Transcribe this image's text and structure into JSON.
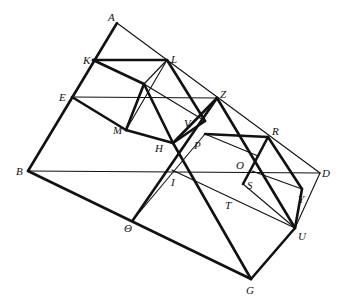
{
  "diagram": {
    "type": "geometric-figure",
    "stroke_color": "#111111",
    "background": "#ffffff",
    "points": {
      "A": [
        117,
        23
      ],
      "K": [
        93,
        60
      ],
      "L": [
        167,
        60
      ],
      "E": [
        72,
        97
      ],
      "Z": [
        217,
        98
      ],
      "M": [
        126,
        130
      ],
      "V": [
        205,
        121
      ],
      "H": [
        173,
        143
      ],
      "P": [
        205,
        134
      ],
      "R": [
        268,
        137
      ],
      "O": [
        258,
        156
      ],
      "S": [
        252,
        171
      ],
      "D": [
        320,
        173
      ],
      "B": [
        28,
        171
      ],
      "I": [
        172,
        170
      ],
      "T": [
        243,
        184
      ],
      "Y": [
        302,
        189
      ],
      "Theta": [
        133,
        220
      ],
      "U": [
        295,
        228
      ],
      "G": [
        251,
        279
      ],
      "N1": [
        144,
        84
      ],
      "N2": [
        272,
        155
      ]
    },
    "labels": [
      {
        "id": "A",
        "text": "A",
        "x": 108,
        "y": 21
      },
      {
        "id": "K",
        "text": "K",
        "x": 83,
        "y": 64
      },
      {
        "id": "L",
        "text": "L",
        "x": 171,
        "y": 63
      },
      {
        "id": "E",
        "text": "E",
        "x": 59,
        "y": 101
      },
      {
        "id": "Z",
        "text": "Z",
        "x": 220,
        "y": 98
      },
      {
        "id": "M",
        "text": "M",
        "x": 113,
        "y": 134
      },
      {
        "id": "V",
        "text": "V",
        "x": 184,
        "y": 127
      },
      {
        "id": "H",
        "text": "H",
        "x": 155,
        "y": 152
      },
      {
        "id": "P",
        "text": "P",
        "x": 194,
        "y": 149
      },
      {
        "id": "R",
        "text": "R",
        "x": 272,
        "y": 135
      },
      {
        "id": "O",
        "text": "O",
        "x": 236,
        "y": 169
      },
      {
        "id": "S",
        "text": "S",
        "x": 247,
        "y": 189
      },
      {
        "id": "D",
        "text": "D",
        "x": 322,
        "y": 177
      },
      {
        "id": "B",
        "text": "B",
        "x": 16,
        "y": 175
      },
      {
        "id": "I",
        "text": "I",
        "x": 171,
        "y": 186
      },
      {
        "id": "T",
        "text": "T",
        "x": 225,
        "y": 209
      },
      {
        "id": "Y",
        "text": "Y",
        "x": 298,
        "y": 203
      },
      {
        "id": "Theta",
        "text": "Θ",
        "x": 124,
        "y": 232
      },
      {
        "id": "U",
        "text": "U",
        "x": 298,
        "y": 240
      },
      {
        "id": "G",
        "text": "G",
        "x": 246,
        "y": 294
      }
    ],
    "thick_segments": [
      [
        "A",
        "B"
      ],
      [
        "B",
        "G"
      ],
      [
        "G",
        "U"
      ],
      [
        "U",
        "Y"
      ],
      [
        "K",
        "L"
      ],
      [
        "K",
        "N1"
      ],
      [
        "E",
        "M"
      ],
      [
        "M",
        "H"
      ],
      [
        "N1",
        "M"
      ],
      [
        "N1",
        "H"
      ],
      [
        "L",
        "V"
      ],
      [
        "H",
        "V"
      ],
      [
        "Z",
        "H"
      ],
      [
        "H",
        "G"
      ],
      [
        "Z",
        "Theta"
      ],
      [
        "Z",
        "U"
      ],
      [
        "P",
        "R"
      ],
      [
        "R",
        "O"
      ],
      [
        "O",
        "T"
      ],
      [
        "R",
        "Y"
      ]
    ],
    "thin_segments": [
      [
        "A",
        "D"
      ],
      [
        "B",
        "D"
      ],
      [
        "E",
        "Z"
      ],
      [
        "D",
        "U"
      ],
      [
        "L",
        "M"
      ],
      [
        "N1",
        "V"
      ],
      [
        "P",
        "O"
      ],
      [
        "P",
        "Theta"
      ],
      [
        "I",
        "U"
      ],
      [
        "S",
        "Y"
      ],
      [
        "T",
        "U"
      ],
      [
        "R",
        "T"
      ],
      [
        "L",
        "N1"
      ]
    ]
  }
}
